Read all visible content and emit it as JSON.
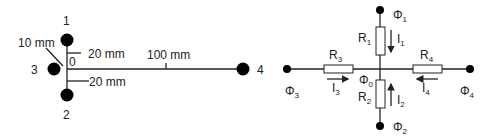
{
  "left_diagram": {
    "electrodes": [
      {
        "id": "1",
        "label": "1"
      },
      {
        "id": "2",
        "label": "2"
      },
      {
        "id": "3",
        "label": "3"
      },
      {
        "id": "4",
        "label": "4"
      }
    ],
    "origin_label": "0",
    "dimensions": {
      "upper": "20 mm",
      "lower": "20 mm",
      "left": "10 mm",
      "right": "100 mm"
    }
  },
  "right_diagram": {
    "center_potential": {
      "symbol": "Φ",
      "sub": "0"
    },
    "nodes": [
      {
        "symbol": "Φ",
        "sub": "1"
      },
      {
        "symbol": "Φ",
        "sub": "2"
      },
      {
        "symbol": "Φ",
        "sub": "3"
      },
      {
        "symbol": "Φ",
        "sub": "4"
      }
    ],
    "resistors": [
      {
        "symbol": "R",
        "sub": "1"
      },
      {
        "symbol": "R",
        "sub": "2"
      },
      {
        "symbol": "R",
        "sub": "3"
      },
      {
        "symbol": "R",
        "sub": "4"
      }
    ],
    "currents": [
      {
        "symbol": "I",
        "sub": "1",
        "direction": "down"
      },
      {
        "symbol": "I",
        "sub": "2",
        "direction": "up"
      },
      {
        "symbol": "I",
        "sub": "3",
        "direction": "right"
      },
      {
        "symbol": "I",
        "sub": "4",
        "direction": "left"
      }
    ]
  }
}
